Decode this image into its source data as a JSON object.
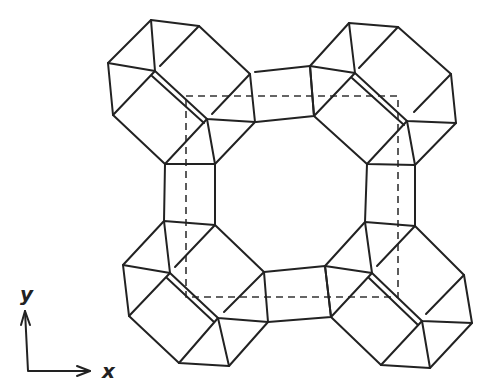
{
  "figure": {
    "axes": {
      "x_label": "x",
      "y_label": "y"
    }
  }
}
